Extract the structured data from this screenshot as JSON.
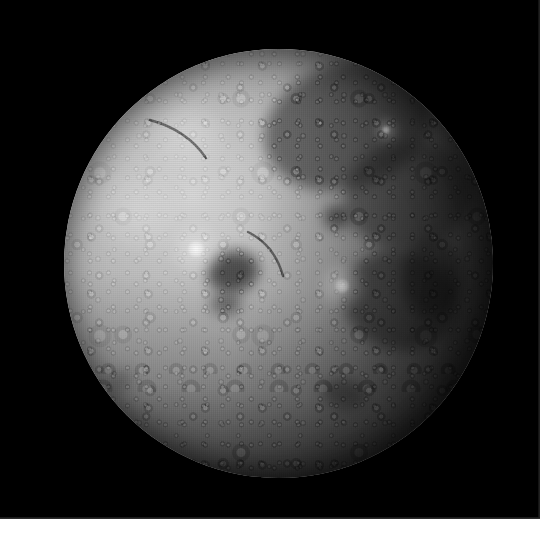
{
  "image": {
    "subject": "Moon",
    "view": "gibbous lunar disk on black sky",
    "canvas_width": 552,
    "canvas_height": 553,
    "background_color": "#000000",
    "page_margin_color": "#ffffff",
    "frame": {
      "x": 0,
      "y": 0,
      "width": 540,
      "height": 519
    }
  },
  "disk": {
    "center_x": 278,
    "center_y": 263,
    "radius": 214,
    "bright_limb": "west / left",
    "dark_limb": "east / right",
    "highlight_color": "#d8d8d8",
    "midtone_color": "#9a9a9a",
    "shadow_color": "#2a2a2a"
  },
  "features": {
    "maria": [
      {
        "name": "mare-northeast",
        "cx": 348,
        "cy": 126,
        "rx": 86,
        "ry": 62,
        "rot": -18,
        "color": "rgba(34,34,34,0.52)"
      },
      {
        "name": "mare-east-central",
        "cx": 408,
        "cy": 196,
        "rx": 64,
        "ry": 54,
        "rot": -8,
        "color": "rgba(30,30,30,0.46)"
      },
      {
        "name": "mare-southeast",
        "cx": 400,
        "cy": 300,
        "rx": 58,
        "ry": 50,
        "rot": 14,
        "color": "rgba(26,26,26,0.50)"
      },
      {
        "name": "mare-far-southeast",
        "cx": 432,
        "cy": 278,
        "rx": 30,
        "ry": 40,
        "rot": 0,
        "color": "rgba(20,20,20,0.48)"
      },
      {
        "name": "dark-crater-floor-central",
        "cx": 233,
        "cy": 272,
        "rx": 26,
        "ry": 21,
        "rot": -12,
        "color": "rgba(46,46,46,0.78)"
      },
      {
        "name": "dark-patch-central-south",
        "cx": 226,
        "cy": 304,
        "rx": 16,
        "ry": 11,
        "rot": 0,
        "color": "rgba(56,56,56,0.62)"
      },
      {
        "name": "dark-crater-upper-right",
        "cx": 337,
        "cy": 217,
        "rx": 13,
        "ry": 11,
        "rot": 0,
        "color": "rgba(40,40,40,0.70)"
      },
      {
        "name": "dark-patch-southwest",
        "cx": 121,
        "cy": 380,
        "rx": 13,
        "ry": 9,
        "rot": -20,
        "color": "rgba(78,78,78,0.48)"
      },
      {
        "name": "dark-patch-south-central",
        "cx": 344,
        "cy": 394,
        "rx": 22,
        "ry": 15,
        "rot": 10,
        "color": "rgba(30,30,30,0.42)"
      }
    ],
    "ray_craters": [
      {
        "name": "ray-crater-south-east",
        "cx": 342,
        "cy": 286,
        "r": 26,
        "core": 7,
        "color": "rgba(255,255,255,0.55)"
      },
      {
        "name": "ray-crater-northeast",
        "cx": 386,
        "cy": 130,
        "r": 14,
        "core": 4,
        "color": "rgba(255,255,255,0.48)"
      },
      {
        "name": "ray-crater-west-highland",
        "cx": 196,
        "cy": 249,
        "r": 30,
        "core": 8,
        "color": "rgba(255,255,255,0.40)"
      },
      {
        "name": "bright-highland-north",
        "cx": 188,
        "cy": 132,
        "r": 42,
        "core": 0,
        "color": "rgba(255,255,255,0.26)"
      },
      {
        "name": "bright-highland-west",
        "cx": 136,
        "cy": 214,
        "r": 48,
        "core": 0,
        "color": "rgba(255,255,255,0.22)"
      }
    ],
    "rilles": [
      {
        "name": "rille-central-ridge",
        "x1": 248,
        "y1": 232,
        "x2": 283,
        "y2": 276
      },
      {
        "name": "rille-north-scarp",
        "x1": 150,
        "y1": 120,
        "x2": 206,
        "y2": 158
      }
    ]
  }
}
